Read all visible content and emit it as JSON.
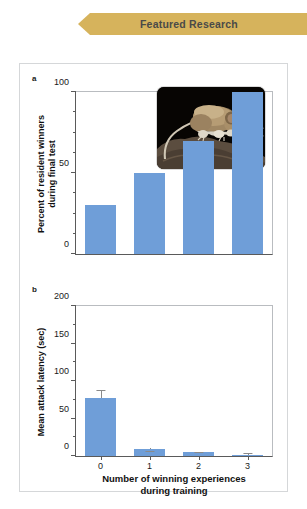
{
  "banner": {
    "label": "Featured Research",
    "color": "#d6b35c"
  },
  "figure": {
    "panel_a_letter": "a",
    "panel_b_letter": "b",
    "bar_color": "#6f9ed8",
    "inset_photo_alt": "mouse-on-rock-photo"
  },
  "chart_data": [
    {
      "type": "bar",
      "panel": "a",
      "title": "",
      "categories": [
        "0",
        "1",
        "2",
        "3"
      ],
      "values": [
        30,
        50,
        70,
        100
      ],
      "xlabel": "",
      "ylabel": "Percent of resident winners\nduring final test",
      "ylim": [
        0,
        100
      ],
      "yticks": [
        0,
        50,
        100
      ],
      "ytick_labels": [
        "0",
        "50",
        "100"
      ],
      "yminor_ticks": [
        12.5,
        25,
        37.5,
        62.5,
        75,
        87.5
      ],
      "grid": false,
      "legend": "none",
      "errors": null
    },
    {
      "type": "bar",
      "panel": "b",
      "title": "",
      "categories": [
        "0",
        "1",
        "2",
        "3"
      ],
      "values": [
        78,
        10,
        5,
        2
      ],
      "errors_upper": [
        87,
        6,
        4,
        3
      ],
      "xlabel": "Number of winning experiences\nduring training",
      "ylabel": "Mean attack latency (sec)",
      "ylim": [
        0,
        200
      ],
      "yticks": [
        0,
        50,
        100,
        150,
        200
      ],
      "ytick_labels": [
        "0",
        "50",
        "100",
        "150",
        "200"
      ],
      "yminor_ticks": [
        25,
        75,
        125,
        175
      ],
      "xtick_labels": [
        "0",
        "1",
        "2",
        "3"
      ],
      "grid": false,
      "legend": "none"
    }
  ]
}
